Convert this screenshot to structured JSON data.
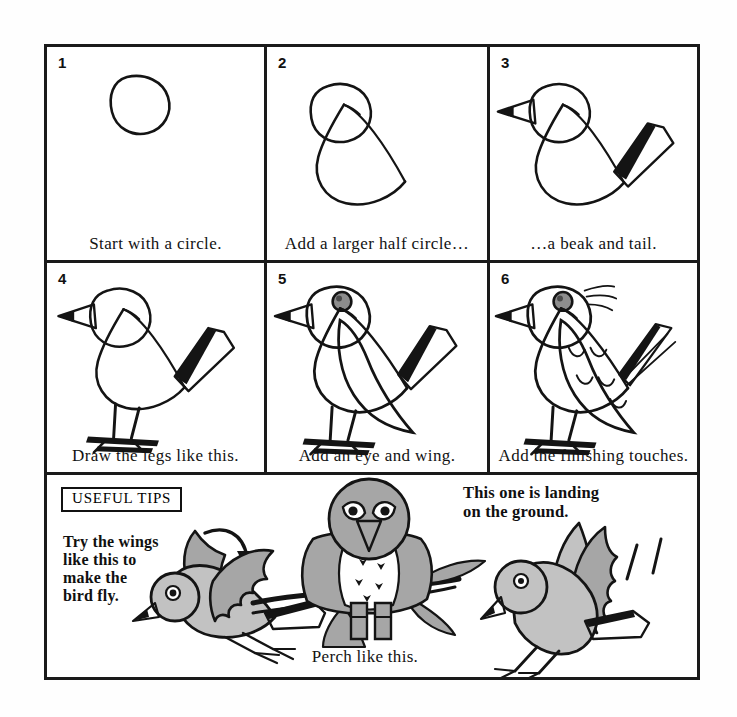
{
  "sheet": {
    "title": "How to draw a bird",
    "background_color": "#fefefe",
    "ink_color": "#141414",
    "gray_fill": "#a6a6a6",
    "light_gray_fill": "#c2c2c2",
    "eye_fill": "#8d8d8d"
  },
  "steps": [
    {
      "number": "1",
      "caption": "Start with a circle."
    },
    {
      "number": "2",
      "caption": "Add a larger half circle…"
    },
    {
      "number": "3",
      "caption": "…a beak and tail."
    },
    {
      "number": "4",
      "caption": "Draw the legs like this."
    },
    {
      "number": "5",
      "caption": "Add an eye and wing."
    },
    {
      "number": "6",
      "caption": "Add the finishing touches."
    }
  ],
  "tips": {
    "badge_label": "USEFUL TIPS",
    "fly_text": "Try the wings\nlike this to\nmake the\nbird fly.",
    "perch_caption": "Perch like this.",
    "landing_text": "This one is landing\non the ground."
  }
}
